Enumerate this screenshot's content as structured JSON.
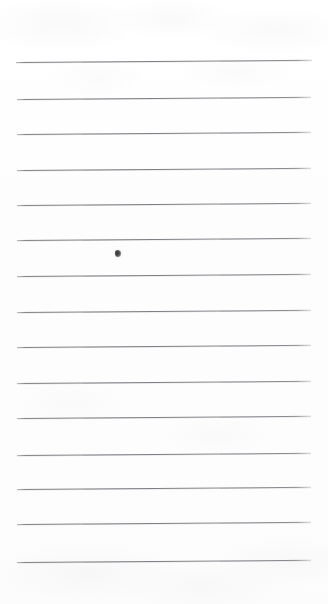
{
  "document": {
    "type": "scanned-lined-paper",
    "title": "Blank lined notebook page",
    "caption": "",
    "page_width": 328,
    "page_height": 604,
    "orientation": "portrait"
  },
  "colors": {
    "paper_background": "#fdfdfd",
    "rule_line": "#7e7e84",
    "ink_mark": "#2e2e30",
    "page_border": "#ffffff"
  },
  "ruling": {
    "style": "wide-ruled",
    "line_count": 15,
    "line_spacing_px": 35.7,
    "line_thickness_px": 1,
    "left_margin_px": 16,
    "right_margin_px": 16,
    "top_margin_px": 62,
    "skew_degrees": -0.42,
    "has_vertical_margin_rule": false,
    "has_header_text": false,
    "has_handwriting": false,
    "lines": [
      {
        "index": 1,
        "y": 62,
        "x_start": 16,
        "x_end": 312,
        "content": ""
      },
      {
        "index": 2,
        "y": 99,
        "x_start": 17,
        "x_end": 311,
        "content": ""
      },
      {
        "index": 3,
        "y": 134,
        "x_start": 17,
        "x_end": 311,
        "content": ""
      },
      {
        "index": 4,
        "y": 170,
        "x_start": 17,
        "x_end": 311,
        "content": ""
      },
      {
        "index": 5,
        "y": 205,
        "x_start": 17,
        "x_end": 311,
        "content": ""
      },
      {
        "index": 6,
        "y": 240,
        "x_start": 17,
        "x_end": 311,
        "content": ""
      },
      {
        "index": 7,
        "y": 276,
        "x_start": 17,
        "x_end": 311,
        "content": ""
      },
      {
        "index": 8,
        "y": 312,
        "x_start": 17,
        "x_end": 311,
        "content": ""
      },
      {
        "index": 9,
        "y": 347,
        "x_start": 17,
        "x_end": 311,
        "content": ""
      },
      {
        "index": 10,
        "y": 383,
        "x_start": 17,
        "x_end": 311,
        "content": ""
      },
      {
        "index": 11,
        "y": 418,
        "x_start": 17,
        "x_end": 311,
        "content": ""
      },
      {
        "index": 12,
        "y": 455,
        "x_start": 17,
        "x_end": 311,
        "content": ""
      },
      {
        "index": 13,
        "y": 489,
        "x_start": 17,
        "x_end": 311,
        "content": ""
      },
      {
        "index": 14,
        "y": 524,
        "x_start": 17,
        "x_end": 311,
        "content": ""
      },
      {
        "index": 15,
        "y": 562,
        "x_start": 17,
        "x_end": 311,
        "content": ""
      }
    ]
  },
  "marks": [
    {
      "name": "ink-speck",
      "description": "small dark ink smudge",
      "x": 115,
      "y": 250,
      "width": 6,
      "height": 7,
      "color": "#2e2e30",
      "on_line_index": 6
    }
  ]
}
